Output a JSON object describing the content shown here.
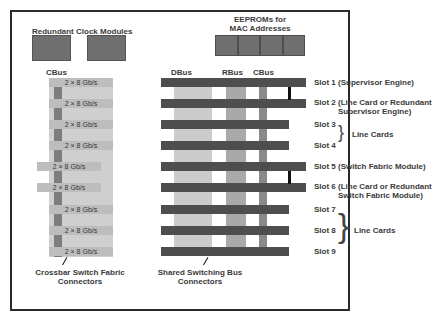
{
  "diagram": {
    "clock_title": "Redundant Clock Modules",
    "eeprom_title_line1": "EEPROMs for",
    "eeprom_title_line2": "MAC Addresses",
    "left_bus_label": "CBus",
    "bus_labels": {
      "dbus": "DBus",
      "rbus": "RBus",
      "cbus": "CBus"
    },
    "crossbar_channels": [
      "2 × 8 Gb/s",
      "2 × 8 Gb/s",
      "2 × 8 Gb/s",
      "2 × 8 Gb/s",
      "2 × 8 Gb/s",
      "2 × 8 Gb/s",
      "2 × 8 Gb/s",
      "2 × 8 Gb/s",
      "2 × 8 Gb/s"
    ],
    "crossbar_caption_line1": "Crossbar Switch Fabric",
    "crossbar_caption_line2": "Connectors",
    "shared_caption_line1": "Shared Switching Bus",
    "shared_caption_line2": "Connectors",
    "slots": {
      "s1": "Slot 1 (Supervisor Engine)",
      "s2a": "Slot 2 (Line Card or Redundant",
      "s2b": "Supervisor Engine)",
      "s3": "Slot 3",
      "s4": "Slot 4",
      "g34": "Line Cards",
      "s5": "Slot 5 (Switch Fabric Module)",
      "s6a": "Slot 6 (Line Card or Redundant",
      "s6b": "Switch Fabric Module)",
      "s7": "Slot 7",
      "s8": "Slot 8",
      "s9": "Slot 9",
      "g789": "Line Cards"
    }
  },
  "colors": {
    "bar_dark": "#4e4e4e",
    "dbus": "#cccccc",
    "rbus": "#a9a9a9",
    "cbus": "#8a8a8a",
    "module": "#6f6f6f"
  }
}
